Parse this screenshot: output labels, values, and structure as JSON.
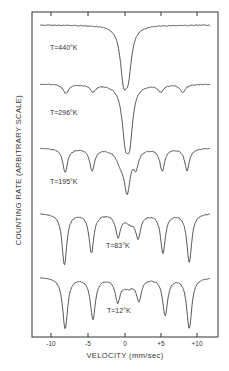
{
  "figure": {
    "title": "",
    "xlabel": "VELOCITY (mm/sec)",
    "ylabel": "COUNTING RATE (ARBITRARY SCALE)"
  },
  "chart_data": {
    "type": "line",
    "title": "",
    "xlabel": "VELOCITY (mm/sec)",
    "ylabel": "COUNTING RATE (ARBITRARY SCALE)",
    "xlim": [
      -12.5,
      12.8
    ],
    "x_ticks": [
      -10,
      -5,
      0,
      5,
      10
    ],
    "x_tick_labels": [
      "-10",
      "-5",
      "0",
      "+5",
      "+10"
    ],
    "grid": false,
    "legend": null,
    "series": [
      {
        "name": "T=440°K",
        "label": "T=440°K",
        "baseline_px": 25,
        "lines": [
          {
            "velocity": -0.2,
            "depth_px": 46,
            "width": 0.55
          },
          {
            "velocity": 0.45,
            "depth_px": 40,
            "width": 0.55
          }
        ]
      },
      {
        "name": "T=296°K",
        "label": "T=296°K",
        "baseline_px": 84,
        "lines": [
          {
            "velocity": -8.1,
            "depth_px": 9,
            "width": 0.45
          },
          {
            "velocity": -4.4,
            "depth_px": 7,
            "width": 0.45
          },
          {
            "velocity": 0.05,
            "depth_px": 48,
            "width": 0.55
          },
          {
            "velocity": 0.65,
            "depth_px": 44,
            "width": 0.5
          },
          {
            "velocity": 4.9,
            "depth_px": 7,
            "width": 0.45
          },
          {
            "velocity": 7.9,
            "depth_px": 8,
            "width": 0.45
          }
        ]
      },
      {
        "name": "T=195°K",
        "label": "T=195°K",
        "baseline_px": 148,
        "lines": [
          {
            "velocity": -8.2,
            "depth_px": 24,
            "width": 0.4
          },
          {
            "velocity": -4.5,
            "depth_px": 22,
            "width": 0.4
          },
          {
            "velocity": -0.6,
            "depth_px": 12,
            "width": 0.7
          },
          {
            "velocity": 0.3,
            "depth_px": 40,
            "width": 0.5
          },
          {
            "velocity": 1.5,
            "depth_px": 16,
            "width": 0.4
          },
          {
            "velocity": 5.1,
            "depth_px": 22,
            "width": 0.4
          },
          {
            "velocity": 8.5,
            "depth_px": 22,
            "width": 0.4
          }
        ]
      },
      {
        "name": "T=83°K",
        "label": "T=83°K",
        "baseline_px": 213,
        "lines": [
          {
            "velocity": -8.3,
            "depth_px": 51,
            "width": 0.4
          },
          {
            "velocity": -4.6,
            "depth_px": 39,
            "width": 0.4
          },
          {
            "velocity": -0.95,
            "depth_px": 22,
            "width": 0.4
          },
          {
            "velocity": 0.7,
            "depth_px": 8,
            "width": 0.9
          },
          {
            "velocity": 1.8,
            "depth_px": 22,
            "width": 0.4
          },
          {
            "velocity": 5.2,
            "depth_px": 39,
            "width": 0.4
          },
          {
            "velocity": 8.8,
            "depth_px": 49,
            "width": 0.4
          }
        ]
      },
      {
        "name": "T=12°K",
        "label": "T=12°K",
        "baseline_px": 277,
        "lines": [
          {
            "velocity": -8.2,
            "depth_px": 51,
            "width": 0.42
          },
          {
            "velocity": -4.4,
            "depth_px": 41,
            "width": 0.42
          },
          {
            "velocity": -1.0,
            "depth_px": 22,
            "width": 0.4
          },
          {
            "velocity": 0.4,
            "depth_px": 9,
            "width": 1.0
          },
          {
            "velocity": 1.9,
            "depth_px": 21,
            "width": 0.4
          },
          {
            "velocity": 5.5,
            "depth_px": 37,
            "width": 0.42
          },
          {
            "velocity": 8.8,
            "depth_px": 51,
            "width": 0.42
          }
        ]
      }
    ]
  },
  "labels": {
    "t440": "T=440°K",
    "t296": "T=296°K",
    "t195": "T=195°K",
    "t83": "T=83°K",
    "t12": "T=12°K",
    "tick_m10": "-10",
    "tick_m5": "-5",
    "tick_0": "0",
    "tick_p5": "+5",
    "tick_p10": "+10"
  }
}
